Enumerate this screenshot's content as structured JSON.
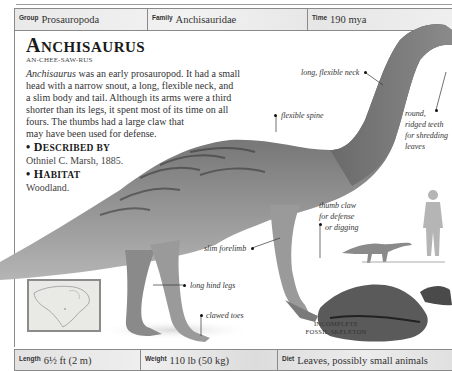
{
  "header": {
    "group": {
      "label": "Group",
      "value": "Prosauropoda"
    },
    "family": {
      "label": "Family",
      "value": "Anchisauridae"
    },
    "time": {
      "label": "Time",
      "value": "190 mya"
    }
  },
  "title": {
    "first": "A",
    "rest": "NCHISAURUS"
  },
  "pronunciation": "AN-CHEE-SAW-RUS",
  "description": {
    "lines": [
      {
        "italic": "Anchisaurus",
        "text": " was an early prosauropod. It had a small"
      },
      {
        "text": "head with a narrow snout, a long, flexible neck, and"
      },
      {
        "text": "a slim body and tail. Although its arms were a third"
      },
      {
        "text": "shorter than its legs, it spent most of its time on all"
      },
      {
        "text": "fours. The thumbs had a large claw that"
      },
      {
        "text": "may have been used for defense."
      }
    ]
  },
  "described_by": {
    "bullet": "•",
    "first": "D",
    "rest": "ESCRIBED BY",
    "value": "Othniel C. Marsh, 1885."
  },
  "habitat": {
    "bullet": "•",
    "first": "H",
    "rest": "ABITAT",
    "value": "Woodland."
  },
  "annotations": {
    "neck": "long, flexible neck",
    "spine": "flexible spine",
    "teeth": [
      "round,",
      "ridged teeth",
      "for shredding",
      "leaves"
    ],
    "thumb": [
      "thumb claw",
      "for defense",
      "or digging"
    ],
    "forelimb": "slim forelimb",
    "hindlegs": "long hind legs",
    "toes": "clawed toes"
  },
  "fossil_caption": [
    "INCOMPLETE",
    "FOSSIL SKELETON"
  ],
  "footer": {
    "length": {
      "label": "Length",
      "value": "6½ ft (2 m)"
    },
    "weight": {
      "label": "Weight",
      "value": "110 lb (50 kg)"
    },
    "diet": {
      "label": "Diet",
      "value": "Leaves, possibly small animals"
    }
  },
  "colors": {
    "border": "#8a8a8a",
    "bar_bg": "#e9e9e9",
    "text": "#333333",
    "dino": "#7a7a7a"
  }
}
